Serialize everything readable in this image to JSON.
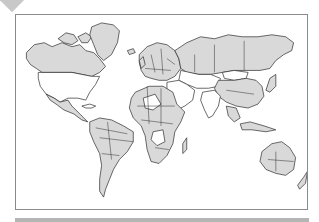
{
  "map": {
    "type": "world-political-outline",
    "projection": "mercator",
    "colors": {
      "land_shaded": "#d9d9d9",
      "land_unshaded": "#ffffff",
      "border": "#2a2a2a",
      "frame": "#8a8a8a",
      "decor": "#c8c8c8"
    },
    "regions_shaded": [
      "Canada",
      "Greenland",
      "Mexico",
      "South America",
      "Europe",
      "Africa (partial)",
      "Russia",
      "China",
      "Australia",
      "Southeast Asia"
    ],
    "regions_unshaded": [
      "United States",
      "Middle East",
      "South Asia",
      "Central Asia"
    ]
  }
}
